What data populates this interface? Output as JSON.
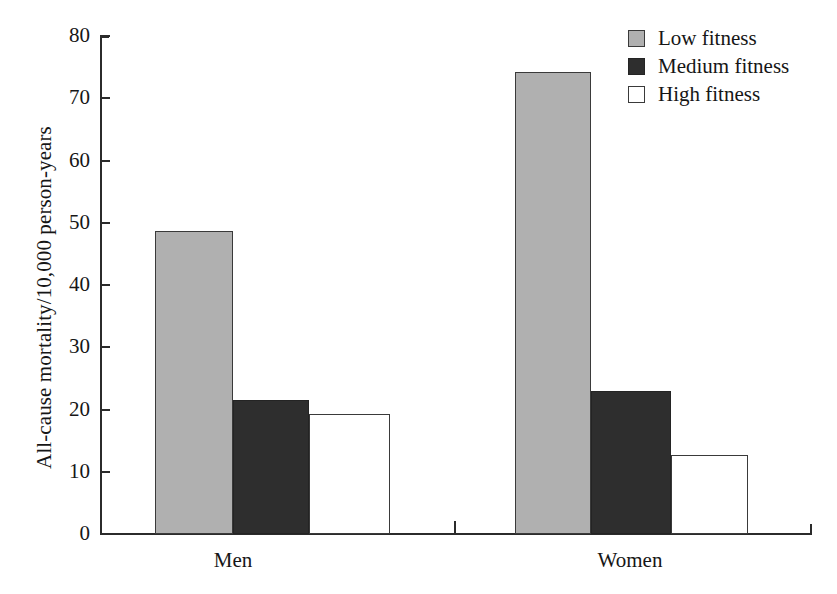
{
  "chart_data": {
    "type": "bar",
    "title": "",
    "subtitle": "",
    "xlabel": "",
    "ylabel": "All-cause mortality/10,000 person-years",
    "categories": [
      "Men",
      "Women"
    ],
    "series": [
      {
        "name": "Low fitness",
        "values": [
          48.7,
          74.2
        ],
        "color": "#b0b0b0"
      },
      {
        "name": "Medium fitness",
        "values": [
          21.6,
          22.9
        ],
        "color": "#2e2e2e"
      },
      {
        "name": "High fitness",
        "values": [
          19.3,
          12.7
        ],
        "color": "#ffffff"
      }
    ],
    "ylim": [
      0,
      80
    ],
    "ytick_values": [
      0,
      10,
      20,
      30,
      40,
      50,
      60,
      70,
      80
    ],
    "ytick_labels": [
      "0",
      "10",
      "20",
      "30",
      "40",
      "50",
      "60",
      "70",
      "80"
    ],
    "grid": false,
    "legend_position": "top-right"
  },
  "legend": {
    "items": [
      {
        "label": "Low fitness",
        "swatch": "legend-swatch-low"
      },
      {
        "label": "Medium fitness",
        "swatch": "legend-swatch-medium"
      },
      {
        "label": "High fitness",
        "swatch": "legend-swatch-high"
      }
    ]
  }
}
